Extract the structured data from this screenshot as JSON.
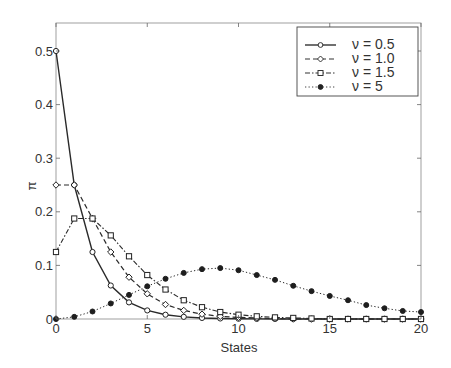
{
  "chart_data": {
    "type": "line",
    "title": "",
    "xlabel": "States",
    "ylabel": "π",
    "xlim": [
      0,
      20
    ],
    "ylim": [
      0,
      0.55
    ],
    "xticks": [
      0,
      5,
      10,
      15,
      20
    ],
    "xtick_labels": [
      "0",
      "5",
      "10",
      "15",
      "20"
    ],
    "yticks": [
      0,
      0.1,
      0.2,
      0.3,
      0.4,
      0.5
    ],
    "ytick_labels": [
      "0",
      "0.1",
      "0.2",
      "0.3",
      "0.4",
      "0.5"
    ],
    "grid": false,
    "legend_position": "upper right",
    "x": [
      0,
      1,
      2,
      3,
      4,
      5,
      6,
      7,
      8,
      9,
      10,
      11,
      12,
      13,
      14,
      15,
      16,
      17,
      18,
      19,
      20
    ],
    "series": [
      {
        "name": "ν = 0.5",
        "line_style": "solid",
        "marker": "circle-open",
        "values": [
          0.5,
          0.25,
          0.125,
          0.0625,
          0.031,
          0.016,
          0.008,
          0.004,
          0.002,
          0.001,
          0.0005,
          0.0002,
          0.0001,
          0,
          0,
          0,
          0,
          0,
          0,
          0,
          0
        ]
      },
      {
        "name": "ν = 1.0",
        "line_style": "dashed",
        "marker": "diamond",
        "values": [
          0.25,
          0.25,
          0.1875,
          0.125,
          0.078,
          0.047,
          0.027,
          0.016,
          0.009,
          0.005,
          0.003,
          0.002,
          0.001,
          0,
          0,
          0,
          0,
          0,
          0,
          0,
          0
        ]
      },
      {
        "name": "ν = 1.5",
        "line_style": "dashdot",
        "marker": "square-open",
        "values": [
          0.125,
          0.1875,
          0.1875,
          0.156,
          0.117,
          0.082,
          0.055,
          0.035,
          0.022,
          0.013,
          0.008,
          0.005,
          0.003,
          0.002,
          0.001,
          0,
          0,
          0,
          0,
          0,
          0
        ]
      },
      {
        "name": "ν = 5",
        "line_style": "dotted",
        "marker": "circle-filled",
        "values": [
          0.0,
          0.004,
          0.014,
          0.029,
          0.045,
          0.061,
          0.075,
          0.086,
          0.093,
          0.095,
          0.091,
          0.082,
          0.073,
          0.062,
          0.052,
          0.043,
          0.035,
          0.026,
          0.02,
          0.015,
          0.013
        ]
      }
    ]
  },
  "legend": {
    "items": [
      {
        "label": "ν  = 0.5"
      },
      {
        "label": "ν  = 1.0"
      },
      {
        "label": "ν  = 1.5"
      },
      {
        "label": "ν  = 5"
      }
    ]
  },
  "axes": {
    "xlabel": "States",
    "ylabel": "π"
  }
}
